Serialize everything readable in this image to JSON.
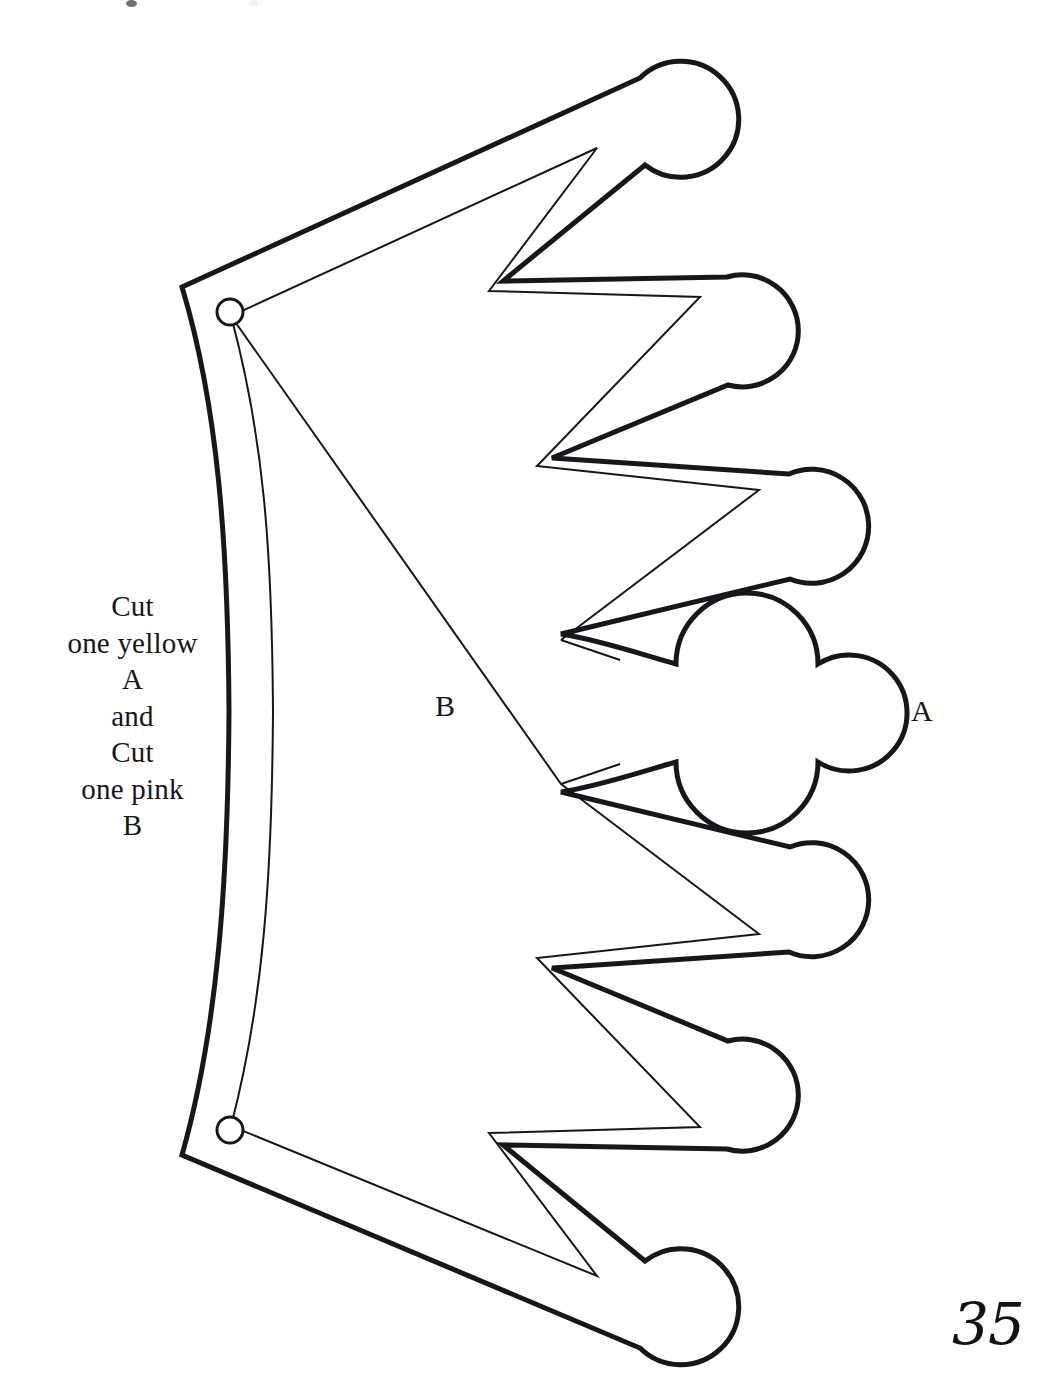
{
  "page": {
    "width": 1043,
    "height": 1375,
    "background_color": "#fefefe",
    "ink_color": "#16171a",
    "page_number": "35",
    "kind": "printed craft pattern / cut-out template page"
  },
  "instructions": {
    "lines": [
      "Cut",
      "one yellow",
      "A",
      "and",
      "Cut",
      "one pink",
      "B"
    ],
    "full_text": "Cut one yellow A and Cut one pink B",
    "align": "center"
  },
  "labels": {
    "piece_b": "B",
    "piece_a": "A"
  },
  "template": {
    "name": "crown-tiara-pattern",
    "orientation": "rotated 90 degrees; crown points face right",
    "symmetry_axis_y": 705,
    "outline_stroke_width": 5,
    "inner_stroke_width": 2,
    "stroke_color": "#16171a",
    "fill_color": "#ffffff",
    "point_count": 7,
    "center_point_style": "trefoil",
    "outer_points": [
      {
        "index": 1,
        "shape": "ball",
        "cx": 686,
        "cy": 120,
        "r": 58
      },
      {
        "index": 2,
        "shape": "ball",
        "cx": 772,
        "cy": 327,
        "r": 56
      },
      {
        "index": 3,
        "shape": "ball",
        "cx": 834,
        "cy": 524,
        "r": 57
      },
      {
        "index": 4,
        "shape": "trefoil",
        "cx": 876,
        "cy": 712,
        "r": 58
      },
      {
        "index": 5,
        "shape": "ball",
        "cx": 834,
        "cy": 900,
        "r": 57
      },
      {
        "index": 6,
        "shape": "ball",
        "cx": 772,
        "cy": 1094,
        "r": 56
      },
      {
        "index": 7,
        "shape": "ball",
        "cx": 686,
        "cy": 1300,
        "r": 58
      }
    ],
    "punch_holes": [
      {
        "cx": 230,
        "cy": 312,
        "r": 13
      },
      {
        "cx": 230,
        "cy": 1130,
        "r": 13
      }
    ],
    "corners": {
      "top_left": {
        "x": 182,
        "y": 287
      },
      "bottom_left": {
        "x": 182,
        "y": 1155
      }
    }
  },
  "scan_artifacts": [
    {
      "x": 126,
      "y": 0,
      "w": 11,
      "h": 7,
      "tone": "dark"
    },
    {
      "x": 249,
      "y": 0,
      "w": 9,
      "h": 6,
      "tone": "light"
    }
  ]
}
